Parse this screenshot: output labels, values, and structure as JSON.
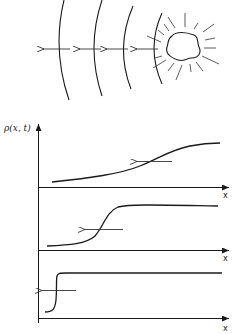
{
  "figure": {
    "top_panel": {
      "description": "Expanding wavefronts emitted leftward from an irregular source",
      "wavefront_count": 4,
      "arrow_direction": "left"
    },
    "bottom_panel": {
      "y_axis_label": "ρ(x, t)",
      "x_axis_label": "x",
      "subplots": [
        {
          "id": 1,
          "shape": "gentle sigmoid",
          "arrow_direction": "left"
        },
        {
          "id": 2,
          "shape": "steep sigmoid",
          "arrow_direction": "left"
        },
        {
          "id": 3,
          "shape": "near step",
          "arrow_direction": "left"
        }
      ]
    },
    "colors": {
      "ink": "#1a1a1a",
      "background": "#ffffff"
    }
  },
  "labels": {
    "rho": "ρ(x, t)",
    "x1": "x",
    "x2": "x",
    "x3": "x"
  }
}
